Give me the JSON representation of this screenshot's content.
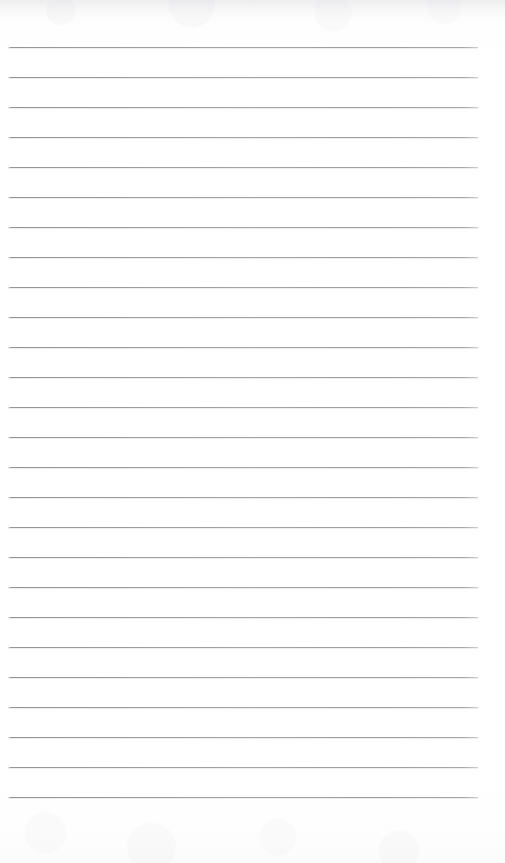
{
  "document": {
    "kind": "ruled-notepad-page",
    "title": "Blank ruled notepad page",
    "content_text": "",
    "written_content": "none",
    "page_width_px": 505,
    "page_height_px": 863,
    "paper_color": "#fefefe",
    "rule_color": "#9a9ca2",
    "rule_count": 26,
    "rule_spacing_px": 30,
    "rule_thickness_px": 1,
    "first_rule_y_px": 47,
    "rule_left_x_px": 8,
    "rule_right_x_px": 478,
    "top_margin_px": 47,
    "bottom_margin_px": 48,
    "rule_positions_y": [
      47,
      77,
      107,
      137,
      167,
      197,
      227,
      257,
      287,
      317,
      317,
      347,
      377,
      407,
      437,
      467,
      497,
      527,
      557,
      587,
      617,
      647,
      677,
      707,
      737,
      767,
      797,
      815
    ],
    "rules": [
      {
        "index": 1,
        "y": 47
      },
      {
        "index": 2,
        "y": 77
      },
      {
        "index": 3,
        "y": 107
      },
      {
        "index": 4,
        "y": 137
      },
      {
        "index": 5,
        "y": 167
      },
      {
        "index": 6,
        "y": 197
      },
      {
        "index": 7,
        "y": 227
      },
      {
        "index": 8,
        "y": 257
      },
      {
        "index": 9,
        "y": 287
      },
      {
        "index": 10,
        "y": 317
      },
      {
        "index": 11,
        "y": 347
      },
      {
        "index": 12,
        "y": 377
      },
      {
        "index": 13,
        "y": 407
      },
      {
        "index": 14,
        "y": 437
      },
      {
        "index": 15,
        "y": 467
      },
      {
        "index": 16,
        "y": 497
      },
      {
        "index": 17,
        "y": 527
      },
      {
        "index": 18,
        "y": 557
      },
      {
        "index": 19,
        "y": 587
      },
      {
        "index": 20,
        "y": 617
      },
      {
        "index": 21,
        "y": 647
      },
      {
        "index": 22,
        "y": 677
      },
      {
        "index": 23,
        "y": 707
      },
      {
        "index": 24,
        "y": 737
      },
      {
        "index": 25,
        "y": 767
      },
      {
        "index": 26,
        "y": 797
      }
    ]
  }
}
